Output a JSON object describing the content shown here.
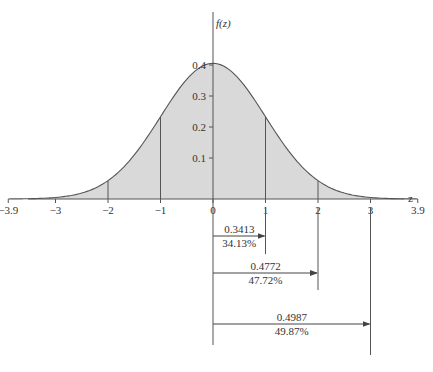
{
  "chart_data": {
    "type": "area",
    "title": "",
    "xlabel": "z",
    "ylabel": "f(z)",
    "x_ticks": [
      "-3.9",
      "-3",
      "-2",
      "-1",
      "0",
      "1",
      "2",
      "3",
      "3.9"
    ],
    "y_ticks": [
      "0.1",
      "0.2",
      "0.3",
      "0.4"
    ],
    "xlim": [
      -3.9,
      3.9
    ],
    "ylim": [
      0,
      0.4
    ],
    "curve": "standard normal density f(z)",
    "vertical_lines_at": [
      -2,
      -1,
      1,
      2
    ],
    "annotations": [
      {
        "from": 0,
        "to": 1,
        "probability": "0.3413",
        "percent": "34.13%"
      },
      {
        "from": 0,
        "to": 2,
        "probability": "0.4772",
        "percent": "47.72%"
      },
      {
        "from": 0,
        "to": 3,
        "probability": "0.4987",
        "percent": "49.87%"
      }
    ],
    "fill_color": "#d9d9d9",
    "line_color": "#555555"
  }
}
